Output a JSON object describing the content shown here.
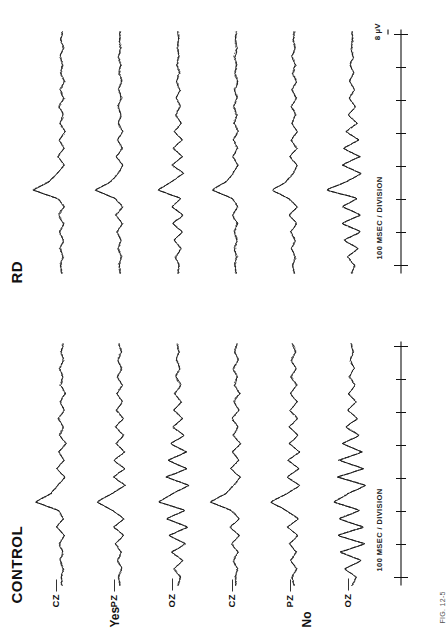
{
  "figure": {
    "caption": "FIG. 12-5",
    "panels": [
      {
        "id": "control",
        "title": "CONTROL",
        "groups": [
          {
            "label": "Yes",
            "electrodes": [
              "CZ",
              "PZ",
              "OZ"
            ]
          },
          {
            "label": "No",
            "electrodes": [
              "CZ",
              "PZ",
              "OZ"
            ]
          }
        ],
        "axis": {
          "time_label": "100 MSEC / DIVISION",
          "amplitude_label": ""
        }
      },
      {
        "id": "rd",
        "title": "RD",
        "groups": [
          {
            "label": "",
            "electrodes": [
              "",
              "",
              ""
            ]
          },
          {
            "label": "",
            "electrodes": [
              "",
              "",
              ""
            ]
          }
        ],
        "axis": {
          "time_label": "100 MSEC / DIVISION",
          "amplitude_label": "8 µV"
        }
      }
    ]
  },
  "chart_data": {
    "type": "line",
    "xlabel": "100 MSEC / DIVISION",
    "ylabel": "8 µV",
    "xlim": [
      -100,
      900
    ],
    "ylim": [
      -8,
      8
    ],
    "grid": false,
    "legend_position": "none",
    "panels": [
      "CONTROL",
      "RD"
    ],
    "conditions": [
      "Yes",
      "No"
    ],
    "electrodes": [
      "CZ",
      "PZ",
      "OZ"
    ],
    "tick_labels": [
      "",
      "",
      "",
      "",
      "",
      "",
      "",
      ""
    ],
    "annotations": [
      "CONTROL",
      "RD",
      "Yes",
      "No",
      "CZ",
      "PZ",
      "OZ",
      "100 MSEC / DIVISION",
      "8 µV"
    ],
    "series": [
      {
        "name": "CONTROL / Yes / CZ",
        "style": "solid",
        "values": [
          0,
          0.2,
          -0.3,
          0.4,
          -0.2,
          0.6,
          -0.5,
          1.2,
          -0.4,
          0.8,
          5.8,
          2.4,
          0.9,
          -0.6,
          1.1,
          -0.4,
          0.7,
          -0.9,
          0.5,
          -0.3,
          0.8,
          -0.5,
          0.4,
          -0.7,
          0.3,
          -0.2,
          0.5,
          -0.4,
          0.2,
          -0.3
        ]
      },
      {
        "name": "CONTROL / Yes / CZ b",
        "style": "dashed",
        "values": [
          0.1,
          -0.2,
          0.3,
          -0.4,
          0.3,
          -0.5,
          0.7,
          -1.0,
          0.6,
          -0.7,
          5.2,
          2.1,
          0.6,
          -0.8,
          0.9,
          -0.6,
          0.5,
          -1.1,
          0.4,
          -0.5,
          0.6,
          -0.7,
          0.3,
          -0.9,
          0.2,
          -0.4,
          0.4,
          -0.6,
          0.1,
          -0.5
        ]
      },
      {
        "name": "CONTROL / Yes / CZ c",
        "style": "dotted",
        "values": [
          -0.1,
          0.3,
          -0.2,
          0.5,
          -0.4,
          0.4,
          -0.6,
          1.1,
          -0.5,
          0.9,
          5.5,
          2.6,
          0.8,
          -0.5,
          1.0,
          -0.3,
          0.6,
          -0.8,
          0.6,
          -0.2,
          0.7,
          -0.4,
          0.5,
          -0.6,
          0.4,
          -0.1,
          0.6,
          -0.3,
          0.3,
          -0.2
        ]
      },
      {
        "name": "CONTROL / Yes / PZ",
        "style": "solid",
        "values": [
          0,
          0.3,
          -0.4,
          0.5,
          -0.3,
          0.9,
          -0.8,
          1.4,
          -0.9,
          1.6,
          5.0,
          1.8,
          -1.2,
          1.4,
          -1.0,
          1.3,
          -1.1,
          0.9,
          -0.8,
          1.0,
          -0.7,
          0.8,
          -0.6,
          0.7,
          -0.5,
          0.6,
          -0.4,
          0.5,
          -0.3,
          0.2
        ]
      },
      {
        "name": "CONTROL / Yes / PZ b",
        "style": "dashed",
        "values": [
          0.2,
          -0.3,
          0.4,
          -0.5,
          0.4,
          -0.8,
          0.9,
          -1.3,
          1.0,
          -1.4,
          4.6,
          1.5,
          -1.0,
          1.2,
          -0.8,
          1.1,
          -0.9,
          0.7,
          -0.6,
          0.8,
          -0.5,
          0.6,
          -0.4,
          0.5,
          -0.3,
          0.4,
          -0.2,
          0.3,
          -0.1,
          0.1
        ]
      },
      {
        "name": "CONTROL / Yes / OZ",
        "style": "solid",
        "values": [
          0,
          -0.5,
          0.8,
          -1.1,
          1.4,
          -1.7,
          2.0,
          -2.2,
          2.5,
          -1.5,
          4.2,
          1.2,
          -2.4,
          2.6,
          -2.0,
          2.2,
          -1.8,
          1.6,
          -1.4,
          1.2,
          -1.0,
          0.9,
          -0.8,
          0.7,
          -0.6,
          0.5,
          -0.4,
          0.3,
          -0.2,
          0.1
        ]
      },
      {
        "name": "CONTROL / Yes / OZ b",
        "style": "dashed",
        "values": [
          -0.2,
          0.4,
          -0.7,
          1.0,
          -1.3,
          1.6,
          -1.9,
          2.1,
          -2.3,
          1.3,
          3.9,
          1.0,
          -2.2,
          2.4,
          -1.8,
          2.0,
          -1.6,
          1.4,
          -1.2,
          1.0,
          -0.9,
          0.8,
          -0.7,
          0.6,
          -0.5,
          0.4,
          -0.3,
          0.2,
          -0.1,
          0.0
        ]
      },
      {
        "name": "CONTROL / No / CZ",
        "style": "solid",
        "values": [
          0,
          0.2,
          -0.3,
          0.6,
          -0.4,
          0.9,
          -0.7,
          1.3,
          -0.8,
          1.0,
          5.6,
          2.2,
          0.5,
          -0.9,
          1.2,
          -0.6,
          0.8,
          -1.0,
          0.6,
          -0.4,
          0.9,
          -0.6,
          0.5,
          -0.8,
          0.4,
          -0.3,
          0.6,
          -0.5,
          0.3,
          -0.2
        ]
      },
      {
        "name": "CONTROL / No / PZ",
        "style": "solid",
        "values": [
          0,
          0.4,
          -0.5,
          0.7,
          -0.5,
          1.0,
          -0.9,
          1.5,
          -1.0,
          1.7,
          5.1,
          1.6,
          -1.3,
          1.5,
          -1.1,
          1.4,
          -1.2,
          1.0,
          -0.9,
          1.1,
          -0.8,
          0.9,
          -0.7,
          0.8,
          -0.6,
          0.7,
          -0.5,
          0.6,
          -0.4,
          0.3
        ]
      },
      {
        "name": "CONTROL / No / OZ",
        "style": "solid",
        "values": [
          0,
          -0.9,
          1.6,
          -2.1,
          2.6,
          -2.9,
          3.2,
          -2.6,
          3.0,
          -1.8,
          4.0,
          0.8,
          -3.0,
          3.2,
          -2.6,
          2.8,
          -2.2,
          2.0,
          -1.6,
          1.4,
          -1.2,
          1.0,
          -0.9,
          0.8,
          -0.7,
          0.6,
          -0.5,
          0.4,
          -0.3,
          0.2
        ]
      },
      {
        "name": "RD / Yes / CZ",
        "style": "solid",
        "values": [
          0,
          0.3,
          -0.2,
          0.4,
          -0.3,
          0.5,
          -0.4,
          0.8,
          -0.5,
          0.9,
          6.4,
          2.8,
          1.0,
          -0.5,
          0.9,
          -0.4,
          0.6,
          -0.7,
          0.5,
          -0.3,
          0.6,
          -0.4,
          0.4,
          -0.5,
          0.3,
          -0.2,
          0.4,
          -0.3,
          0.2,
          -0.1
        ]
      },
      {
        "name": "RD / Yes / PZ",
        "style": "solid",
        "values": [
          0,
          0.2,
          -0.3,
          0.4,
          -0.2,
          0.6,
          -0.5,
          0.9,
          -0.6,
          1.1,
          5.4,
          2.0,
          0.4,
          -0.6,
          0.8,
          -0.5,
          0.5,
          -0.6,
          0.4,
          -0.3,
          0.5,
          -0.4,
          0.3,
          -0.4,
          0.2,
          -0.2,
          0.3,
          -0.2,
          0.1,
          -0.1
        ]
      },
      {
        "name": "RD / Yes / OZ",
        "style": "solid",
        "values": [
          0,
          -0.3,
          0.5,
          -0.7,
          0.9,
          -1.0,
          1.2,
          -1.1,
          1.3,
          -0.7,
          4.4,
          1.4,
          -1.2,
          1.3,
          -1.0,
          1.1,
          -0.9,
          0.8,
          -0.7,
          0.6,
          -0.5,
          0.4,
          -0.4,
          0.3,
          -0.3,
          0.2,
          -0.2,
          0.1,
          -0.1,
          0.0
        ]
      },
      {
        "name": "RD / No / CZ",
        "style": "solid",
        "values": [
          0,
          0.2,
          -0.2,
          0.3,
          -0.2,
          0.4,
          -0.3,
          0.7,
          -0.4,
          0.8,
          5.2,
          2.2,
          0.6,
          -0.4,
          0.7,
          -0.3,
          0.5,
          -0.5,
          0.4,
          -0.2,
          0.5,
          -0.3,
          0.3,
          -0.4,
          0.2,
          -0.1,
          0.3,
          -0.2,
          0.1,
          -0.1
        ]
      },
      {
        "name": "RD / No / PZ",
        "style": "solid",
        "values": [
          0,
          0.3,
          -0.3,
          0.5,
          -0.3,
          0.7,
          -0.6,
          1.0,
          -0.7,
          1.2,
          4.8,
          1.7,
          0.2,
          -0.7,
          0.9,
          -0.6,
          0.6,
          -0.7,
          0.5,
          -0.4,
          0.6,
          -0.5,
          0.4,
          -0.5,
          0.3,
          -0.3,
          0.4,
          -0.3,
          0.2,
          -0.1
        ]
      },
      {
        "name": "RD / No / OZ",
        "style": "solid",
        "values": [
          0,
          -0.6,
          1.0,
          -1.4,
          1.8,
          -2.0,
          2.3,
          -1.9,
          2.1,
          -1.2,
          5.6,
          1.2,
          -2.0,
          2.2,
          -1.8,
          1.9,
          -1.5,
          1.3,
          -1.1,
          0.9,
          -0.8,
          0.7,
          -0.6,
          0.5,
          -0.4,
          0.3,
          -0.3,
          0.2,
          -0.1,
          0.0
        ]
      }
    ]
  }
}
